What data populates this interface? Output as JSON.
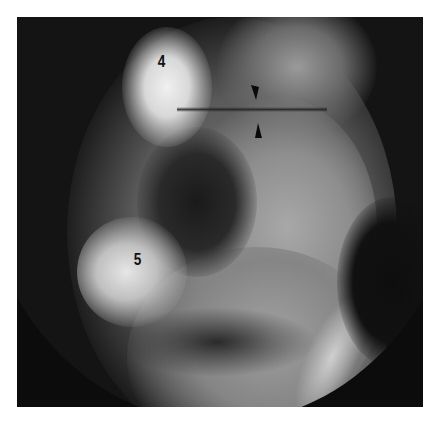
{
  "figure": {
    "type": "radiograph",
    "labels": [
      {
        "text": "4",
        "x": 162,
        "y": 62
      },
      {
        "text": "5",
        "x": 138,
        "y": 262
      }
    ],
    "annotations": [
      {
        "type": "arrowhead",
        "direction": "down",
        "tip": [
          256,
          100
        ]
      },
      {
        "type": "arrowhead",
        "direction": "up",
        "tip": [
          258,
          123
        ]
      }
    ],
    "colors": {
      "background": "#0c0c0c",
      "bone_bright": "#e8e8e8",
      "soft_tissue": "#8a8a8a",
      "labels": "#111111",
      "page": "#ffffff"
    }
  }
}
